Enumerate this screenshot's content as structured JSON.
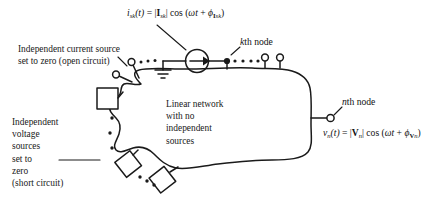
{
  "figure": {
    "background_color": "#ffffff",
    "line_color": "#1a1a1a",
    "text_color": "#1a1a1a"
  },
  "labels": {
    "current_source_note": "Independent current source\nset to zero (open circuit)",
    "voltage_source_note": "Independent\nvoltage\nsources\nset to\nzero\n(short circuit)",
    "network_block": "Linear network\nwith no\nindependent\nsources",
    "kth_node": "th node",
    "kth_node_symbol": "k",
    "nth_node": "th node",
    "nth_node_symbol": "n"
  },
  "equations": {
    "current": {
      "lhs_symbol": "i",
      "lhs_subscript": "sk",
      "lhs_arg": "(t)",
      "equals": "=",
      "magnitude_open": "|",
      "magnitude_symbol": "I",
      "magnitude_subscript": "sk",
      "magnitude_close": "|",
      "cos": "cos",
      "paren_open": "(",
      "omega": "ω",
      "time": "t",
      "plus": "+",
      "phi": "ϕ",
      "phi_subscript_bold": "I",
      "phi_subscript_italic": "sk",
      "paren_close": ")",
      "plain": "i_sk(t) = |I_sk| cos (ωt + ϕ_Isk)"
    },
    "voltage": {
      "lhs_symbol": "v",
      "lhs_subscript": "n",
      "lhs_arg": "(t)",
      "equals": "=",
      "magnitude_open": "|",
      "magnitude_symbol": "V",
      "magnitude_subscript": "n",
      "magnitude_close": "|",
      "cos": "cos",
      "paren_open": "(",
      "omega": "ω",
      "time": "t",
      "plus": "+",
      "phi": "ϕ",
      "phi_subscript_bold": "V",
      "phi_subscript_italic": "n",
      "paren_close": ")",
      "plain": "v_n(t) = |V_n| cos (ωt + ϕ_Vn)"
    }
  },
  "elements": {
    "current_source": "circle with right arrow",
    "ground": "ground-symbol-three-bars",
    "open_terminals_count": 4,
    "shorted_source_squares": 3,
    "kth_node_marker": "filled-dot",
    "nth_node_marker": "open-circle",
    "ellipsis_groups": [
      "top-left",
      "top-right",
      "left-vertical",
      "bottom-left"
    ]
  }
}
